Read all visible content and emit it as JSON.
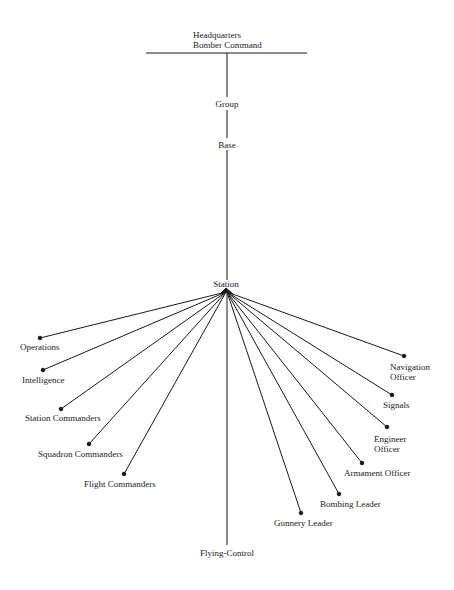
{
  "diagram": {
    "type": "organization-chart",
    "colors": {
      "line": "#1a1a1a",
      "text": "#1a1a1a",
      "background": "#ffffff"
    },
    "hierarchy": [
      {
        "id": "hq",
        "label_line1": "Headquarters",
        "label_line2": "Bomber Command"
      },
      {
        "id": "group",
        "label": "Group"
      },
      {
        "id": "base",
        "label": "Base"
      },
      {
        "id": "station",
        "label": "Station"
      }
    ],
    "station_branches": [
      {
        "id": "operations",
        "label": "Operations"
      },
      {
        "id": "intelligence",
        "label": "Intelligence"
      },
      {
        "id": "station-commanders",
        "label": "Station Commanders"
      },
      {
        "id": "squadron-commanders",
        "label": "Squadron Commanders"
      },
      {
        "id": "flight-commanders",
        "label": "Flight Commanders"
      },
      {
        "id": "flying-control",
        "label": "Flying-Control"
      },
      {
        "id": "gunnery-leader",
        "label": "Gunnery Leader"
      },
      {
        "id": "bombing-leader",
        "label": "Bombing Leader"
      },
      {
        "id": "armament-officer",
        "label": "Armament Officer"
      },
      {
        "id": "engineer-officer",
        "label_line1": "Engineer",
        "label_line2": "Officer"
      },
      {
        "id": "signals",
        "label": "Signals"
      },
      {
        "id": "navigation-officer",
        "label_line1": "Navigation",
        "label_line2": "Officer"
      }
    ]
  }
}
